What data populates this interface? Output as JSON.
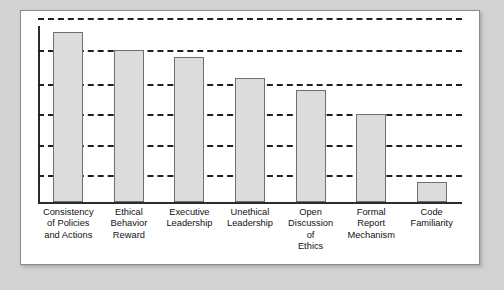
{
  "figure": {
    "panel_background": "#ffffff",
    "page_background": "#d2d2d2",
    "border_color": "#8a8a8a"
  },
  "chart_data": {
    "type": "bar",
    "title": "",
    "subtitle": "",
    "xlabel": "",
    "ylabel": "",
    "categories": [
      "Consistency\nof Policies\nand Actions",
      "Ethical\nBehavior\nReward",
      "Executive\nLeadership",
      "Unethical\nLeadership",
      "Open\nDiscussion\nof\nEthics",
      "Formal\nReport\nMechanism",
      "Code\nFamiliarity"
    ],
    "values": [
      92.6,
      82.4,
      79.0,
      67.6,
      60.8,
      47.7,
      10.8
    ],
    "ylim": [
      0,
      100
    ],
    "grid": true,
    "grid_style": "dashed",
    "grid_color": "#1f1f1f",
    "gridline_values": [
      100,
      82.4,
      64.2,
      47.7,
      31.2,
      14.8
    ],
    "legend": "none",
    "bar_fill_color": "#dcdcdc",
    "bar_edge_color": "#6f6f6f",
    "axis_color": "#2b2b2b",
    "tick_labels_x": [
      "Consistency of Policies and Actions",
      "Ethical Behavior Reward",
      "Executive Leadership",
      "Unethical Leadership",
      "Open Discussion of Ethics",
      "Formal Report Mechanism",
      "Code Familiarity"
    ],
    "tick_labels_y": []
  }
}
